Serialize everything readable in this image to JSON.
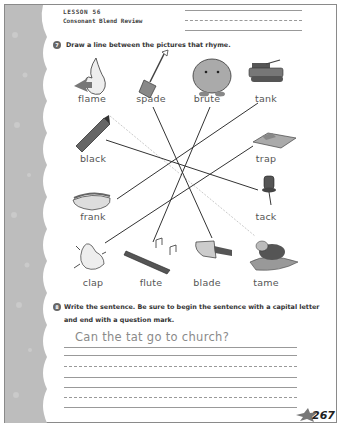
{
  "header": {
    "lesson": "LESSON 56",
    "subtitle": "Consonant Blend Review"
  },
  "activity7": {
    "number": "7",
    "instruction": "Draw a line between the pictures that rhyme.",
    "pictures": [
      {
        "word": "flame",
        "icon": "flame-icon"
      },
      {
        "word": "spade",
        "icon": "spade-shovel-icon"
      },
      {
        "word": "brute",
        "icon": "brute-monster-icon"
      },
      {
        "word": "tank",
        "icon": "tank-icon"
      },
      {
        "word": "black",
        "icon": "crayon-icon"
      },
      {
        "word": "trap",
        "icon": "trap-icon"
      },
      {
        "word": "frank",
        "icon": "hotdog-icon"
      },
      {
        "word": "tack",
        "icon": "thumbtack-icon"
      },
      {
        "word": "clap",
        "icon": "clapping-hands-icon"
      },
      {
        "word": "flute",
        "icon": "flute-icon"
      },
      {
        "word": "blade",
        "icon": "knife-blade-icon"
      },
      {
        "word": "tame",
        "icon": "cat-on-pillow-icon"
      }
    ],
    "matches": [
      {
        "from": "spade",
        "to": "blade",
        "style": "solid"
      },
      {
        "from": "brute",
        "to": "flute",
        "style": "solid"
      },
      {
        "from": "tank",
        "to": "frank",
        "style": "solid"
      },
      {
        "from": "black",
        "to": "tack",
        "style": "solid"
      },
      {
        "from": "trap",
        "to": "clap",
        "style": "solid"
      },
      {
        "from": "flame",
        "to": "tame",
        "style": "dotted"
      }
    ]
  },
  "activity8": {
    "number": "8",
    "instruction_line1": "Write the sentence. Be sure to begin the sentence with a capital letter",
    "instruction_line2": "and end with a question mark.",
    "sample_sentence": "Can the tat go to church?"
  },
  "footer": {
    "page_number": "267"
  }
}
